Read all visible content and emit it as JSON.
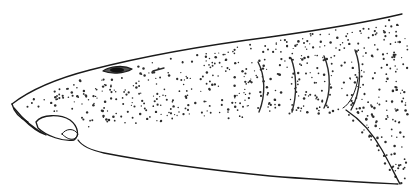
{
  "figure": {
    "subject": "Lateral view of shark head (line illustration)",
    "style": "stippled pen-and-ink drawing",
    "colors": {
      "ink": "#1a1a1a",
      "background": "#ffffff"
    }
  },
  "parts": {
    "dorsal_outline": "M12,104 C30,90 55,79 90,70 C140,57 200,46 270,37 C320,30 360,24 402,14",
    "snout_underside": "M12,104 C14,112 20,118 28,122",
    "labial_fold": "M14,108 C22,118 32,128 46,135 C40,133 30,126 22,118",
    "lip_oval": "M36,122 C42,114 60,114 70,120 C78,126 80,136 74,140 C64,142 46,136 38,128 Z",
    "lip_inner": "M62,134 C66,128 74,128 78,134 C76,140 70,142 62,134 Z",
    "ventral_outline": "M78,140 C82,146 90,150 104,153 C150,162 210,170 270,176 C320,180 360,182 398,184",
    "eye": "M103,71 C110,66 124,65 132,69 C124,74 110,74 103,71 Z",
    "eye_pupil": {
      "cx": 117,
      "cy": 70,
      "rx": 7,
      "ry": 2.5
    },
    "spiracle": "M153,71 L164,68",
    "gill_slits": [
      "M258,62 C265,75 266,95 259,112",
      "M291,58 C297,74 297,95 292,112",
      "M324,56 C331,72 331,94 324,108",
      "M355,50 C362,68 361,92 351,110"
    ],
    "pectoral_fin": "M346,110 C358,118 372,132 382,150 C390,164 395,175 400,184",
    "pectoral_inner": "M343,108 C350,104 356,92 358,78"
  },
  "stipple": {
    "seed": 7,
    "count": 620,
    "color": "#2b2b2b"
  }
}
